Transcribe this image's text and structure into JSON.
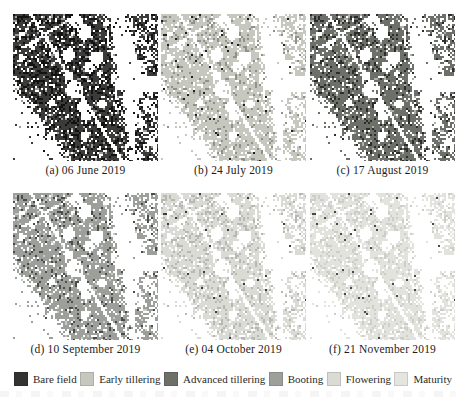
{
  "figure": {
    "panels": [
      {
        "id": "a",
        "caption": "(a) 06 June 2019",
        "stage": "Bare field",
        "base": "#3b3b39",
        "speck": "#121212",
        "speck_prob": 0.3,
        "dot": "#9e9e9e",
        "dot_prob": 0.06
      },
      {
        "id": "b",
        "caption": "(b) 24 July 2019",
        "stage": "Early tillering",
        "base": "#c6c8c0",
        "speck": "#8f9289",
        "speck_prob": 0.1,
        "dot": "#222222",
        "dot_prob": 0.02
      },
      {
        "id": "c",
        "caption": "(c) 17 August 2019",
        "stage": "Advanced tillering",
        "base": "#6d6f69",
        "speck": "#2d2d2b",
        "speck_prob": 0.15,
        "dot": "#aeb0aa",
        "dot_prob": 0.05
      },
      {
        "id": "d",
        "caption": "(d) 10 September 2019",
        "stage": "Booting",
        "base": "#9da09a",
        "speck": "#4b4d47",
        "speck_prob": 0.1,
        "dot": "#c9cbc5",
        "dot_prob": 0.05
      },
      {
        "id": "e",
        "caption": "(e) 04 October 2019",
        "stage": "Flowering",
        "base": "#dadbd4",
        "speck": "#b6b8b1",
        "speck_prob": 0.16,
        "dot": "#3f3f3f",
        "dot_prob": 0.012
      },
      {
        "id": "f",
        "caption": "(f) 21 November 2019",
        "stage": "Maturity",
        "base": "#e2e3dc",
        "speck": "#cdcec8",
        "speck_prob": 0.16,
        "dot": "#4a4a4a",
        "dot_prob": 0.015
      }
    ],
    "legend": {
      "items": [
        {
          "label": "Bare field",
          "color": "#333331"
        },
        {
          "label": "Early tillering",
          "color": "#c6c8c0"
        },
        {
          "label": "Advanced tillering",
          "color": "#6d6f69"
        },
        {
          "label": "Booting",
          "color": "#9da09a"
        },
        {
          "label": "Flowering",
          "color": "#dadbd4"
        },
        {
          "label": "Maturity",
          "color": "#e4e5de"
        }
      ]
    }
  }
}
